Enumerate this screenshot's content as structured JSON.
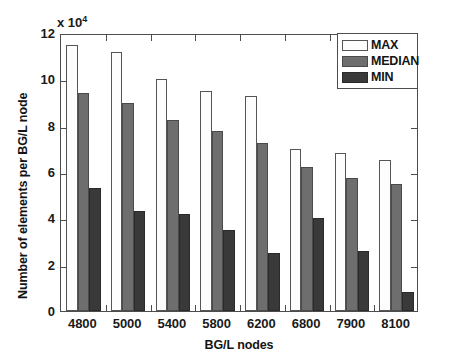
{
  "chart_data": {
    "type": "bar",
    "title": "",
    "xlabel": "BG/L nodes",
    "ylabel": "Number of elements per BG/L node",
    "y_multiplier_text": "x 10",
    "y_multiplier_exponent": "4",
    "y_multiplier_value": 10000,
    "categories": [
      "4800",
      "5000",
      "5400",
      "5800",
      "6200",
      "6800",
      "7900",
      "8100"
    ],
    "series": [
      {
        "name": "MAX",
        "color": "#fdfdfd",
        "values": [
          11.5,
          11.2,
          10.0,
          9.5,
          9.3,
          7.0,
          6.8,
          6.5
        ]
      },
      {
        "name": "MEDIAN",
        "color": "#6e6e6e",
        "values": [
          9.4,
          9.0,
          8.25,
          7.75,
          7.25,
          6.2,
          5.75,
          5.5
        ]
      },
      {
        "name": "MIN",
        "color": "#393939",
        "values": [
          5.3,
          4.3,
          4.2,
          3.5,
          2.5,
          4.0,
          2.6,
          0.8
        ]
      }
    ],
    "ylim": [
      0,
      12
    ],
    "yticks": [
      0,
      2,
      4,
      6,
      8,
      10,
      12
    ],
    "ytick_labels": [
      "0",
      "2",
      "4",
      "6",
      "8",
      "10",
      "12"
    ],
    "grid": false,
    "legend_position": "top-right",
    "legend_entries": [
      "MAX",
      "MEDIAN",
      "MIN"
    ]
  }
}
